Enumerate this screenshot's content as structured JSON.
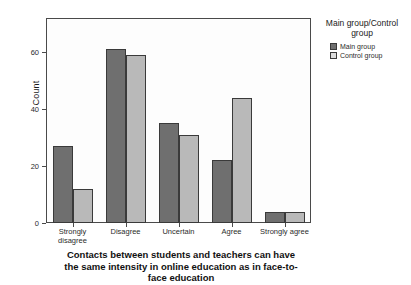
{
  "chart_data": {
    "type": "bar",
    "title_lines": [
      "Contacts between students and teachers can have",
      "the same intensity in online education as in face-to-",
      "face education"
    ],
    "xlabel": "",
    "ylabel": "Count",
    "categories": [
      "Strongly disagree",
      "Disagree",
      "Uncertain",
      "Agree",
      "Strongly agree"
    ],
    "category_lines": [
      [
        "Strongly",
        "disagree"
      ],
      [
        "Disagree"
      ],
      [
        "Uncertain"
      ],
      [
        "Agree"
      ],
      [
        "Strongly agree"
      ]
    ],
    "series": [
      {
        "name": "Main group",
        "color": "#6f6f6f",
        "values": [
          27,
          61,
          35,
          22,
          4
        ]
      },
      {
        "name": "Control group",
        "color": "#b9b9b9",
        "values": [
          12,
          59,
          31,
          44,
          4
        ]
      }
    ],
    "ylim": [
      0,
      72
    ],
    "yticks": [
      0,
      20,
      40,
      60
    ],
    "ytick_labels": [
      "0",
      "20",
      "40",
      "60"
    ],
    "grid": false,
    "legend_position": "right"
  },
  "legend": {
    "title": "Main group/Control group",
    "title_lines": [
      "Main group/Control",
      "group"
    ],
    "items": [
      {
        "label": "Main group"
      },
      {
        "label": "Control group"
      }
    ]
  }
}
